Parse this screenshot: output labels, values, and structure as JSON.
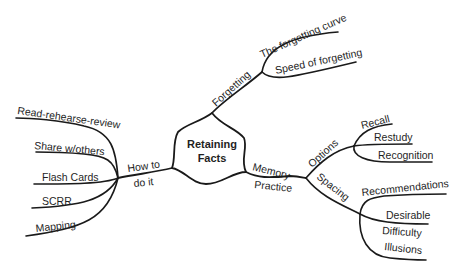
{
  "diagram": {
    "type": "mind-map",
    "center": {
      "line1": "Retaining",
      "line2": "Facts"
    },
    "branches": [
      {
        "label": "Forgetting",
        "children": [
          "The forgetting curve",
          "Speed of forgetting"
        ]
      },
      {
        "label_line1": "How to",
        "label_line2": "do it",
        "children": [
          "Read-rehearse-review",
          "Share w/others",
          "Flash Cards",
          "SCRR",
          "Mapping"
        ]
      },
      {
        "label_line1": "Memory",
        "label_line2": "Practice",
        "children": [
          {
            "label": "Options",
            "children": [
              "Recall",
              "Restudy",
              "Recognition"
            ]
          },
          {
            "label": "Spacing",
            "children": [
              "Recommendations",
              "Desirable",
              "Difficulty",
              "Illusions"
            ]
          }
        ]
      }
    ],
    "colors": {
      "line": "#1a1a1a",
      "text": "#1f1f1f",
      "background": "#ffffff"
    }
  }
}
